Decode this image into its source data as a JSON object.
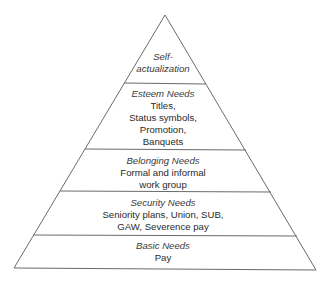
{
  "diagram": {
    "type": "pyramid",
    "tiers": [
      {
        "title": "Self-",
        "lines": [
          "actualization"
        ],
        "title_italic_continues": true
      },
      {
        "title": "Esteem Needs",
        "lines": [
          "Titles,",
          "Status symbols,",
          "Promotion,",
          "Banquets"
        ]
      },
      {
        "title": "Belonging Needs",
        "lines": [
          "Formal and informal",
          "work group"
        ]
      },
      {
        "title": "Security Needs",
        "lines": [
          "Seniority plans, Union, SUB,",
          "GAW, Severence pay"
        ]
      },
      {
        "title": "Basic Needs",
        "lines": [
          "Pay"
        ]
      }
    ],
    "line_color": "#6b6b6b"
  }
}
